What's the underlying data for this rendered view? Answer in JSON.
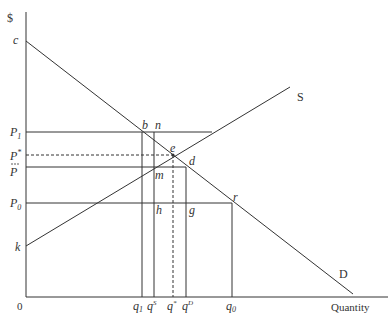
{
  "diagram": {
    "title_fragment": "",
    "axes": {
      "y_label": "$",
      "x_label": "Quantity",
      "origin_label": "0"
    },
    "curves": {
      "supply_label": "S",
      "demand_label": "D"
    },
    "price_labels": {
      "c": "c",
      "p1": "P",
      "p1_sub": "1",
      "pstar": "P",
      "pstar_sup": "*",
      "pbar": "P",
      "p0": "P",
      "p0_sub": "0",
      "k": "k"
    },
    "quantity_labels": {
      "q1": "q",
      "q1_sub": "1",
      "qs": "q",
      "qs_sup": "S",
      "qstar": "q",
      "qstar_sup": "*",
      "qd": "q",
      "qd_sup": "D",
      "q0": "q",
      "q0_sub": "0"
    },
    "points": {
      "b": "b",
      "n": "n",
      "e": "e",
      "d": "d",
      "m": "m",
      "h": "h",
      "g": "g",
      "r": "r"
    },
    "colors": {
      "line": "#333333",
      "background": "#ffffff"
    }
  }
}
